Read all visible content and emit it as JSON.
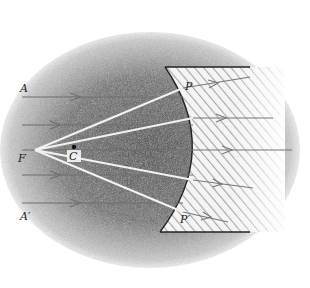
{
  "figure": {
    "type": "optics-diagram",
    "labels": {
      "A": "A",
      "A_prime": "A′",
      "F": "F",
      "C": "C",
      "P": "P",
      "P_prime": "P′"
    },
    "colors": {
      "shading_dark": "#4a4a4a",
      "shading_mid": "#8a8a8a",
      "hatch": "#9a9a9a",
      "mirror_line": "#222222",
      "incident_ray": "#6e6e6e",
      "virtual_ray": "#f2f2f2"
    },
    "incident_rays_y": [
      97,
      125,
      150,
      175,
      203
    ],
    "mirror_points": [
      {
        "x": 183,
        "y": 88
      },
      {
        "x": 193,
        "y": 118
      },
      {
        "x": 197,
        "y": 150
      },
      {
        "x": 193,
        "y": 180
      },
      {
        "x": 183,
        "y": 210
      }
    ]
  }
}
